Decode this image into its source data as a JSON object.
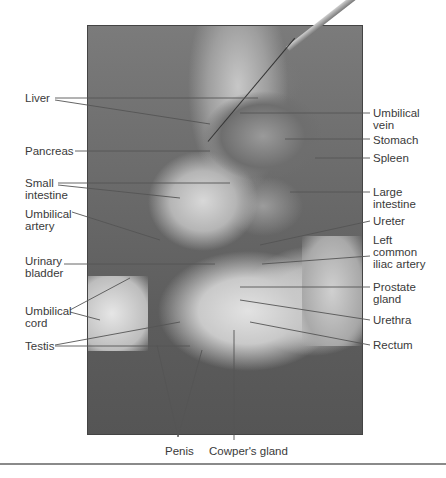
{
  "figure": {
    "labels_left": [
      {
        "id": "liver",
        "text": "Liver"
      },
      {
        "id": "pancreas",
        "text": "Pancreas"
      },
      {
        "id": "small-intestine",
        "text": "Small\nintestine"
      },
      {
        "id": "umbilical-artery",
        "text": "Umbilical\nartery"
      },
      {
        "id": "urinary-bladder",
        "text": "Urinary\nbladder"
      },
      {
        "id": "umbilical-cord",
        "text": "Umbilical\ncord"
      },
      {
        "id": "testis",
        "text": "Testis"
      }
    ],
    "labels_right": [
      {
        "id": "umbilical-vein",
        "text": "Umbilical\nvein"
      },
      {
        "id": "stomach",
        "text": "Stomach"
      },
      {
        "id": "spleen",
        "text": "Spleen"
      },
      {
        "id": "large-intestine",
        "text": "Large\nintestine"
      },
      {
        "id": "ureter",
        "text": "Ureter"
      },
      {
        "id": "left-common-iliac-artery",
        "text": "Left\ncommon\niliac artery"
      },
      {
        "id": "prostate-gland",
        "text": "Prostate\ngland"
      },
      {
        "id": "urethra",
        "text": "Urethra"
      },
      {
        "id": "rectum",
        "text": "Rectum"
      }
    ],
    "labels_bottom": [
      {
        "id": "penis",
        "text": "Penis"
      },
      {
        "id": "cowpers-gland",
        "text": "Cowper's gland"
      }
    ]
  }
}
